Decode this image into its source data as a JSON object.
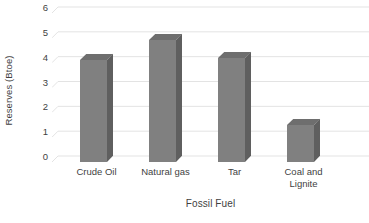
{
  "chart_data": {
    "type": "bar",
    "title": "",
    "subtitle": "",
    "xlabel": "Fossil Fuel",
    "ylabel": "Reserves (Btoe)",
    "categories": [
      "Crude Oil",
      "Natural gas",
      "Tar",
      "Coal and Lignite"
    ],
    "values": [
      4.1,
      4.9,
      4.2,
      1.5
    ],
    "series": [
      {
        "name": "Reserves",
        "values": [
          4.1,
          4.9,
          4.2,
          1.5
        ]
      }
    ],
    "ylim": [
      0,
      6
    ],
    "ytick_labels": [
      "0",
      "1",
      "2",
      "3",
      "4",
      "5",
      "6"
    ],
    "ytick_values": [
      0,
      1,
      2,
      3,
      4,
      5,
      6
    ],
    "grid": true,
    "grid_axis": "y",
    "legend": false,
    "legend_position": "none",
    "three_d": true,
    "bar_color": "#808080",
    "bar_top_color": "#6e6e6e",
    "bar_side_color": "#5f5f5f",
    "grid_color": "#e3e3e3",
    "text_color": "#3f3f3f",
    "background_color": "#ffffff",
    "annotations": []
  },
  "category_labels": [
    {
      "line1": "Crude Oil",
      "line2": ""
    },
    {
      "line1": "Natural gas",
      "line2": ""
    },
    {
      "line1": "Tar",
      "line2": ""
    },
    {
      "line1": "Coal and",
      "line2": "Lignite"
    }
  ]
}
